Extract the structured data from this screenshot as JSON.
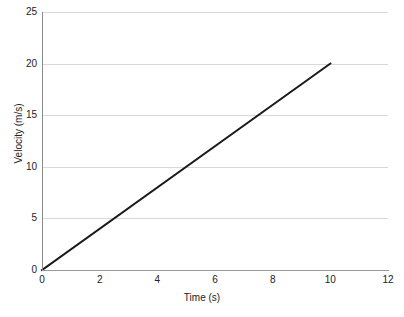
{
  "chart_data": {
    "type": "line",
    "title": "",
    "subtitle": "",
    "xlabel": "Time (s)",
    "ylabel": "Velocity (m/s)",
    "xlim": [
      0,
      12
    ],
    "ylim": [
      0,
      25
    ],
    "xticks": [
      0,
      2,
      4,
      6,
      8,
      10,
      12
    ],
    "xtick_labels": [
      "0",
      "2",
      "4",
      "6",
      "8",
      "10",
      "12"
    ],
    "yticks": [
      0,
      5,
      10,
      15,
      20,
      25
    ],
    "ytick_labels": [
      "0",
      "5",
      "10",
      "15",
      "20",
      "25"
    ],
    "grid": {
      "horizontal": true,
      "vertical": false,
      "color": "#d8d8d8"
    },
    "legend": {
      "visible": false,
      "position": "none",
      "entries": []
    },
    "annotations": [],
    "series": [
      {
        "name": "velocity",
        "color": "#1a1a1a",
        "line_width": 2,
        "x": [
          0,
          10
        ],
        "values": [
          0,
          20
        ],
        "points": [
          {
            "x": 0,
            "y": 0
          },
          {
            "x": 1,
            "y": 2
          },
          {
            "x": 2,
            "y": 4
          },
          {
            "x": 3,
            "y": 6
          },
          {
            "x": 4,
            "y": 8
          },
          {
            "x": 5,
            "y": 10
          },
          {
            "x": 6,
            "y": 12
          },
          {
            "x": 7,
            "y": 14
          },
          {
            "x": 8,
            "y": 16
          },
          {
            "x": 9,
            "y": 18
          },
          {
            "x": 10,
            "y": 20
          }
        ]
      }
    ],
    "colors": {
      "line": "#1a1a1a",
      "grid": "#d8d8d8",
      "axis": "#8a8a8a",
      "text": "#222222",
      "background": "#ffffff"
    }
  }
}
